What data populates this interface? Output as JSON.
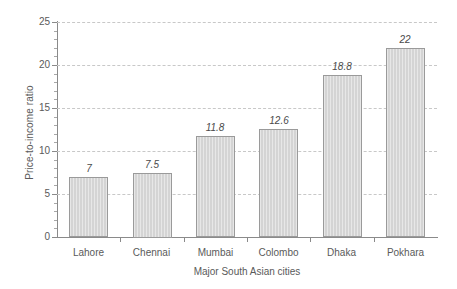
{
  "chart_data": {
    "type": "bar",
    "title": "",
    "subtitle": "",
    "categories": [
      "Lahore",
      "Chennai",
      "Mumbai",
      "Colombo",
      "Dhaka",
      "Pokhara"
    ],
    "values": [
      7,
      7.5,
      11.8,
      12.6,
      18.8,
      22
    ],
    "value_labels": [
      "7",
      "7.5",
      "11.8",
      "12.6",
      "18.8",
      "22"
    ],
    "xlabel": "Major South Asian cities",
    "ylabel": "Price-to-income ratio",
    "ylim": [
      0,
      25
    ],
    "ytick_labels": [
      "0",
      "5",
      "10",
      "15",
      "20",
      "25"
    ],
    "ytick_values": [
      0,
      5,
      10,
      15,
      20,
      25
    ],
    "y_minor_tick_step": 1,
    "grid": "horizontal-dashed",
    "legend": "none",
    "colors": {
      "bar_fill": "#d4d4d4",
      "bar_border": "#9a9a9a",
      "gridline": "#c8c8c8",
      "axis": "#8a8a8a",
      "text": "#5a5a5a",
      "background": "#ffffff"
    }
  }
}
